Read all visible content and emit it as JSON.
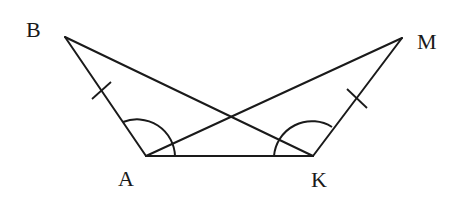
{
  "diagram": {
    "type": "geometry",
    "points": {
      "B": {
        "label": "B",
        "x": 65,
        "y": 37,
        "lx": 26,
        "ly": 37
      },
      "A": {
        "label": "A",
        "x": 146,
        "y": 156,
        "lx": 118,
        "ly": 186
      },
      "K": {
        "label": "K",
        "x": 313,
        "y": 156,
        "lx": 311,
        "ly": 187
      },
      "M": {
        "label": "M",
        "x": 402,
        "y": 38,
        "lx": 417,
        "ly": 49
      }
    },
    "segments": [
      {
        "from": "B",
        "to": "A"
      },
      {
        "from": "B",
        "to": "K"
      },
      {
        "from": "A",
        "to": "K"
      },
      {
        "from": "A",
        "to": "M"
      },
      {
        "from": "K",
        "to": "M"
      }
    ],
    "equal_marks": [
      {
        "segment": "BA",
        "marks": 1
      },
      {
        "segment": "KM",
        "marks": 1
      }
    ],
    "equal_angles": [
      {
        "vertex": "A",
        "between": [
          "B",
          "K"
        ],
        "arcs": 1
      },
      {
        "vertex": "K",
        "between": [
          "A",
          "M"
        ],
        "arcs": 1
      }
    ]
  }
}
